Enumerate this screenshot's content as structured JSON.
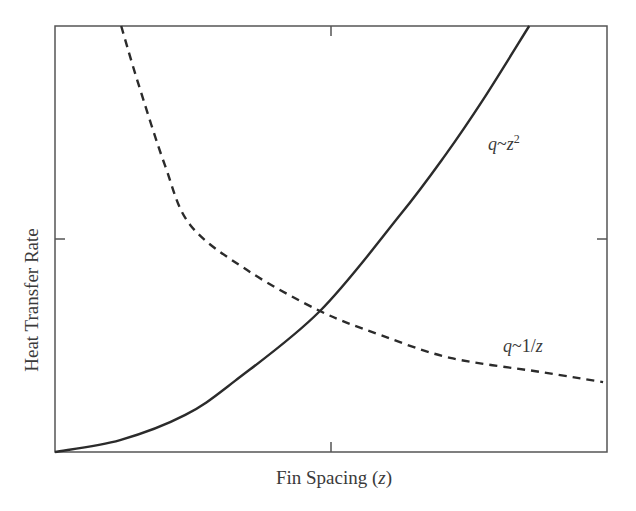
{
  "chart_data": {
    "type": "line",
    "title": "",
    "xlabel": "Fin Spacing (z)",
    "xlabel_parts": {
      "prefix": "Fin Spacing (",
      "var": "z",
      "suffix": ")"
    },
    "ylabel": "Heat Transfer Rate",
    "xlim": [
      0,
      1
    ],
    "ylim": [
      0,
      1
    ],
    "axis_ticks": {
      "x": [
        0.5
      ],
      "y": [
        0.5
      ],
      "tick_labels": "none"
    },
    "grid": false,
    "legend": "inline curve labels",
    "series": [
      {
        "name": "q~z^2",
        "label_display": {
          "q": "q",
          "tilde": "~",
          "z": "z",
          "exp": "2"
        },
        "style": "solid",
        "color": "#2b2b2b",
        "x": [
          0,
          0.118,
          0.236,
          0.326,
          0.48,
          0.625,
          0.707,
          0.775,
          0.859
        ],
        "y": [
          0,
          0.028,
          0.087,
          0.167,
          0.331,
          0.556,
          0.697,
          0.826,
          1.0
        ]
      },
      {
        "name": "q~1/z",
        "label_display": {
          "q": "q",
          "tilde": "~",
          "num": "1/",
          "z": "z"
        },
        "style": "dashed",
        "color": "#2b2b2b",
        "x": [
          0.12,
          0.149,
          0.199,
          0.245,
          0.348,
          0.48,
          0.589,
          0.716,
          0.879,
          0.993
        ],
        "y": [
          1.0,
          0.873,
          0.674,
          0.533,
          0.427,
          0.331,
          0.275,
          0.221,
          0.188,
          0.164
        ]
      }
    ],
    "annotations": [
      {
        "text": "q~z^2",
        "near_series": 0
      },
      {
        "text": "q~1/z",
        "near_series": 1
      }
    ],
    "intersection": {
      "x": 0.48,
      "y": 0.331
    }
  },
  "colors": {
    "axis": "#555555",
    "curve": "#2b2b2b",
    "background": "#ffffff"
  }
}
